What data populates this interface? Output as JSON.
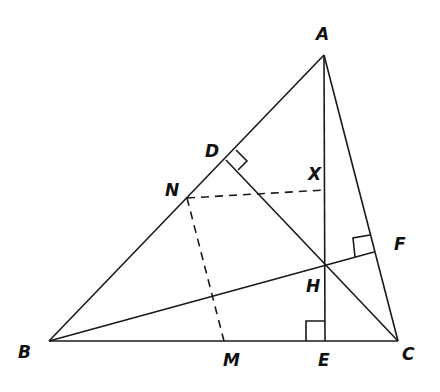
{
  "diagram": {
    "type": "geometry",
    "points": {
      "A": {
        "label": "A",
        "x": 324,
        "y": 55,
        "lx": 316,
        "ly": 40
      },
      "B": {
        "label": "B",
        "x": 49,
        "y": 341,
        "lx": 18,
        "ly": 358
      },
      "C": {
        "label": "C",
        "x": 398,
        "y": 341,
        "lx": 402,
        "ly": 360
      },
      "D": {
        "label": "D",
        "x": 226,
        "y": 160,
        "lx": 205,
        "ly": 157
      },
      "E": {
        "label": "E",
        "x": 325,
        "y": 341,
        "lx": 318,
        "ly": 366
      },
      "F": {
        "label": "F",
        "x": 374,
        "y": 252,
        "lx": 394,
        "ly": 250
      },
      "H": {
        "label": "H",
        "x": 325,
        "y": 264,
        "lx": 306,
        "ly": 292
      },
      "M": {
        "label": "M",
        "x": 224,
        "y": 341,
        "lx": 223,
        "ly": 366
      },
      "N": {
        "label": "N",
        "x": 187,
        "y": 198,
        "lx": 165,
        "ly": 196
      },
      "X": {
        "label": "X",
        "x": 325,
        "y": 190,
        "lx": 308,
        "ly": 180
      }
    },
    "solid_segments": [
      [
        "A",
        "B"
      ],
      [
        "B",
        "C"
      ],
      [
        "C",
        "A"
      ],
      [
        "A",
        "E"
      ],
      [
        "C",
        "D"
      ],
      [
        "B",
        "F"
      ]
    ],
    "dashed_segments": [
      [
        "N",
        "X"
      ],
      [
        "N",
        "M"
      ]
    ],
    "right_angles": [
      "D",
      "E",
      "F"
    ]
  }
}
